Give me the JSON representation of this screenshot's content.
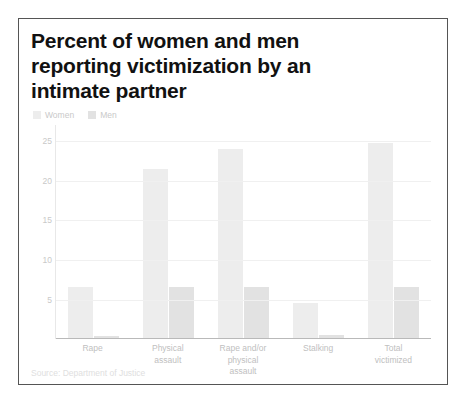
{
  "chart_data": {
    "type": "bar",
    "title": "Percent of women and men reporting victimization by an intimate partner",
    "xlabel": "",
    "ylabel": "",
    "ylim": [
      0,
      27
    ],
    "yticks": [
      5,
      10,
      15,
      20,
      25
    ],
    "grid": true,
    "legend_position": "top-left",
    "categories": [
      "Rape",
      "Physical assault",
      "Rape and/or physical assault",
      "Stalking",
      "Total victimized"
    ],
    "series": [
      {
        "name": "Women",
        "color": "#ededed",
        "values": [
          6.5,
          21.5,
          24.0,
          4.5,
          24.8
        ]
      },
      {
        "name": "Men",
        "color": "#e2e2e2",
        "values": [
          0.3,
          6.5,
          6.5,
          0.4,
          6.5
        ]
      }
    ],
    "source": "Source: Department of Justice"
  },
  "chart": {
    "title_line1": "Percent of women and men",
    "title_line2": "reporting victimization by an",
    "title_line3": "intimate partner",
    "legend": [
      {
        "label": "Women"
      },
      {
        "label": "Men"
      }
    ],
    "ytick_labels": [
      "25",
      "20",
      "15",
      "10",
      "5"
    ],
    "category_labels": [
      "Rape",
      "Physical\nassault",
      "Rape and/or\nphysical\nassault",
      "Stalking",
      "Total\nvictimized"
    ],
    "source": "Source: Department of Justice"
  },
  "colors": {
    "women_bar": "#ededed",
    "men_bar": "#e2e2e2",
    "frame_border": "#555555",
    "gridline": "#f0f0f0",
    "tick_text": "#c9c9c9",
    "title_text": "#111111"
  }
}
